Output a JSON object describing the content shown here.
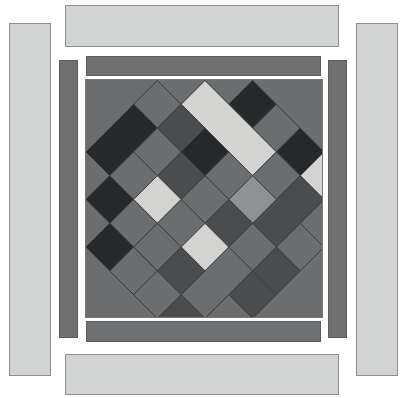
{
  "artwork": {
    "title": "Diagonal lattice quilt composition",
    "canvas": {
      "width": 407,
      "height": 398,
      "background": "#ffffff"
    },
    "palette": {
      "outer_bar_fill": "#d2d3d3",
      "outer_bar_stroke": "#8d8e8e",
      "inner_bar_fill": "#6e7071",
      "inner_bar_stroke": "#5a5c5d",
      "pattern_background": "#6b6d6e",
      "tone_lightest": "#d3d4d2",
      "tone_light": "#8f9192",
      "tone_mid": "#6b6d6e",
      "tone_dark": "#4a4c4d",
      "tone_darkest": "#26282a",
      "tile_stroke": "#3a3c3d"
    },
    "outer_bars": [
      {
        "name": "top-outer-bar",
        "x": 65,
        "y": 5,
        "w": 274,
        "h": 42
      },
      {
        "name": "bottom-outer-bar",
        "x": 65,
        "y": 354,
        "w": 274,
        "h": 41
      },
      {
        "name": "left-outer-bar",
        "x": 9,
        "y": 23,
        "w": 42,
        "h": 353
      },
      {
        "name": "right-outer-bar",
        "x": 356,
        "y": 23,
        "w": 42,
        "h": 353
      }
    ],
    "inner_bars": [
      {
        "name": "top-inner-bar",
        "x": 86,
        "y": 56,
        "w": 235,
        "h": 20
      },
      {
        "name": "bottom-inner-bar",
        "x": 86,
        "y": 321,
        "w": 235,
        "h": 21
      },
      {
        "name": "left-inner-bar",
        "x": 59,
        "y": 60,
        "w": 19,
        "h": 278
      },
      {
        "name": "right-inner-bar",
        "x": 328,
        "y": 60,
        "w": 19,
        "h": 278
      }
    ],
    "pattern_frame": {
      "name": "pattern-field",
      "x": 85,
      "y": 79,
      "w": 238,
      "h": 239
    },
    "lattice": {
      "pitch": 47.6,
      "rows": 7,
      "cols": 7,
      "orientation": "45-degree diamonds"
    },
    "tiles": [
      {
        "id": "t01",
        "cx": 0,
        "cy": 0,
        "rw": 1,
        "rh": 1,
        "tone": "tone_dark"
      },
      {
        "id": "t02",
        "cx": 1,
        "cy": 0,
        "rw": 1,
        "rh": 1,
        "tone": "tone_mid"
      },
      {
        "id": "t03",
        "cx": 2,
        "cy": 0,
        "rw": 1,
        "rh": 1,
        "tone": "tone_darkest"
      },
      {
        "id": "t04",
        "cx": 3,
        "cy": 0,
        "rw": 1,
        "rh": 1,
        "tone": "tone_mid"
      },
      {
        "id": "t05",
        "cx": 4,
        "cy": 0,
        "rw": 1,
        "rh": 1,
        "tone": "tone_darkest"
      },
      {
        "id": "t06",
        "cx": 5,
        "cy": 0,
        "rw": 1,
        "rh": 1,
        "tone": "tone_lightest"
      },
      {
        "id": "t07",
        "cx": 6,
        "cy": 0,
        "rw": 1,
        "rh": 1,
        "tone": "tone_darkest"
      },
      {
        "id": "t08",
        "cx": 0,
        "cy": 1,
        "rw": 1,
        "rh": 1,
        "tone": "tone_mid"
      },
      {
        "id": "t09",
        "cx": 1,
        "cy": 1,
        "rw": 3,
        "rh": 1,
        "tone": "tone_lightest"
      },
      {
        "id": "t10",
        "cx": 4,
        "cy": 1,
        "rw": 1,
        "rh": 1,
        "tone": "tone_mid"
      },
      {
        "id": "t11",
        "cx": 5,
        "cy": 1,
        "rw": 1,
        "rh": 2,
        "tone": "tone_dark"
      },
      {
        "id": "t12",
        "cx": 6,
        "cy": 1,
        "rw": 1,
        "rh": 1,
        "tone": "tone_mid"
      },
      {
        "id": "t13",
        "cx": 0,
        "cy": 2,
        "rw": 1,
        "rh": 1,
        "tone": "tone_mid"
      },
      {
        "id": "t14",
        "cx": 1,
        "cy": 2,
        "rw": 1,
        "rh": 1,
        "tone": "tone_dark"
      },
      {
        "id": "t15",
        "cx": 2,
        "cy": 2,
        "rw": 1,
        "rh": 1,
        "tone": "tone_darkest"
      },
      {
        "id": "t16",
        "cx": 3,
        "cy": 2,
        "rw": 1,
        "rh": 1,
        "tone": "tone_mid"
      },
      {
        "id": "t17",
        "cx": 4,
        "cy": 2,
        "rw": 1,
        "rh": 1,
        "tone": "tone_light"
      },
      {
        "id": "t18",
        "cx": 6,
        "cy": 2,
        "rw": 1,
        "rh": 1,
        "tone": "tone_mid"
      },
      {
        "id": "t19",
        "cx": 0,
        "cy": 3,
        "rw": 1,
        "rh": 2,
        "tone": "tone_darkest"
      },
      {
        "id": "t20",
        "cx": 1,
        "cy": 3,
        "rw": 1,
        "rh": 1,
        "tone": "tone_mid"
      },
      {
        "id": "t21",
        "cx": 2,
        "cy": 3,
        "rw": 1,
        "rh": 1,
        "tone": "tone_dark"
      },
      {
        "id": "t22",
        "cx": 3,
        "cy": 3,
        "rw": 1,
        "rh": 1,
        "tone": "tone_mid"
      },
      {
        "id": "t23",
        "cx": 4,
        "cy": 3,
        "rw": 1,
        "rh": 1,
        "tone": "tone_dark"
      },
      {
        "id": "t24",
        "cx": 5,
        "cy": 3,
        "rw": 1,
        "rh": 1,
        "tone": "tone_mid"
      },
      {
        "id": "t25",
        "cx": 6,
        "cy": 3,
        "rw": 1,
        "rh": 1,
        "tone": "tone_dark"
      },
      {
        "id": "t26",
        "cx": 1,
        "cy": 4,
        "rw": 1,
        "rh": 1,
        "tone": "tone_mid"
      },
      {
        "id": "t27",
        "cx": 2,
        "cy": 4,
        "rw": 1,
        "rh": 1,
        "tone": "tone_lightest"
      },
      {
        "id": "t28",
        "cx": 3,
        "cy": 4,
        "rw": 1,
        "rh": 1,
        "tone": "tone_mid"
      },
      {
        "id": "t29",
        "cx": 4,
        "cy": 4,
        "rw": 1,
        "rh": 1,
        "tone": "tone_lightest"
      },
      {
        "id": "t30",
        "cx": 5,
        "cy": 4,
        "rw": 1,
        "rh": 2,
        "tone": "tone_mid"
      },
      {
        "id": "t31",
        "cx": 6,
        "cy": 4,
        "rw": 1,
        "rh": 1,
        "tone": "tone_dark"
      },
      {
        "id": "t32",
        "cx": 0,
        "cy": 5,
        "rw": 1,
        "rh": 1,
        "tone": "tone_mid"
      },
      {
        "id": "t33",
        "cx": 1,
        "cy": 5,
        "rw": 1,
        "rh": 1,
        "tone": "tone_darkest"
      },
      {
        "id": "t34",
        "cx": 2,
        "cy": 5,
        "rw": 1,
        "rh": 1,
        "tone": "tone_mid"
      },
      {
        "id": "t35",
        "cx": 3,
        "cy": 5,
        "rw": 1,
        "rh": 1,
        "tone": "tone_mid"
      },
      {
        "id": "t36",
        "cx": 4,
        "cy": 5,
        "rw": 1,
        "rh": 1,
        "tone": "tone_dark"
      },
      {
        "id": "t37",
        "cx": 6,
        "cy": 5,
        "rw": 1,
        "rh": 1,
        "tone": "tone_mid"
      },
      {
        "id": "t38",
        "cx": 0,
        "cy": 6,
        "rw": 1,
        "rh": 1,
        "tone": "tone_mid"
      },
      {
        "id": "t39",
        "cx": 1,
        "cy": 6,
        "rw": 1,
        "rh": 1,
        "tone": "tone_mid"
      },
      {
        "id": "t40",
        "cx": 2,
        "cy": 6,
        "rw": 1,
        "rh": 1,
        "tone": "tone_darkest"
      },
      {
        "id": "t41",
        "cx": 3,
        "cy": 6,
        "rw": 1,
        "rh": 1,
        "tone": "tone_mid"
      },
      {
        "id": "t42",
        "cx": 4,
        "cy": 6,
        "rw": 1,
        "rh": 1,
        "tone": "tone_mid"
      },
      {
        "id": "t43",
        "cx": 5,
        "cy": 6,
        "rw": 1,
        "rh": 1,
        "tone": "tone_dark"
      },
      {
        "id": "t44",
        "cx": 6,
        "cy": 6,
        "rw": 1,
        "rh": 1,
        "tone": "tone_mid"
      }
    ]
  }
}
